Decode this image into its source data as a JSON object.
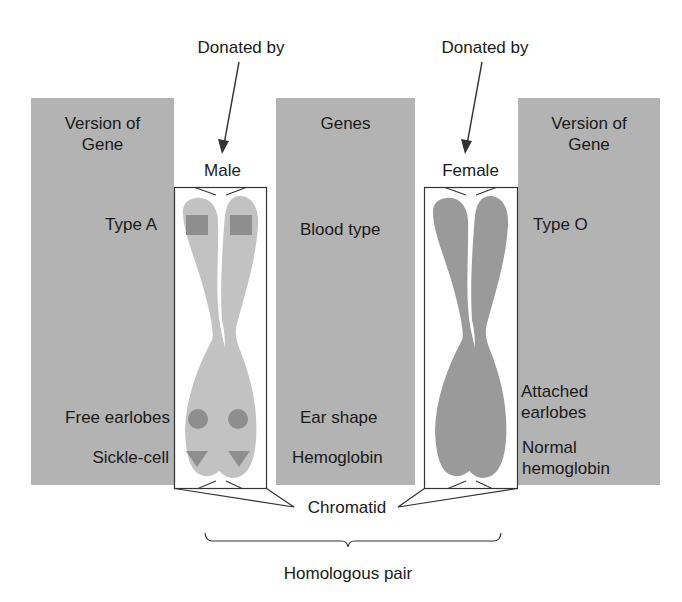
{
  "labels": {
    "donated_by_left": "Donated by",
    "donated_by_right": "Donated by",
    "male": "Male",
    "female": "Female",
    "chromatid": "Chromatid",
    "homologous_pair": "Homologous pair"
  },
  "columns": {
    "left": {
      "header_line1": "Version of",
      "header_line2": "Gene"
    },
    "middle": {
      "header": "Genes"
    },
    "right": {
      "header_line1": "Version of",
      "header_line2": "Gene"
    }
  },
  "rows": [
    {
      "gene": "Blood type",
      "male_version": "Type A",
      "female_version": "Type O",
      "marker": "square"
    },
    {
      "gene": "Ear shape",
      "male_version": "Free earlobes",
      "female_version_line1": "Attached",
      "female_version_line2": "earlobes",
      "marker": "circle"
    },
    {
      "gene": "Hemoglobin",
      "male_version": "Sickle-cell",
      "female_version_line1": "Normal",
      "female_version_line2": "hemoglobin",
      "marker": "triangle"
    }
  ],
  "colors": {
    "panel": "#b3b3b3",
    "male_chromosome": "#c2c2c2",
    "female_chromosome": "#9a9a9a",
    "marker": "#8e8e8e",
    "line": "#333333"
  }
}
